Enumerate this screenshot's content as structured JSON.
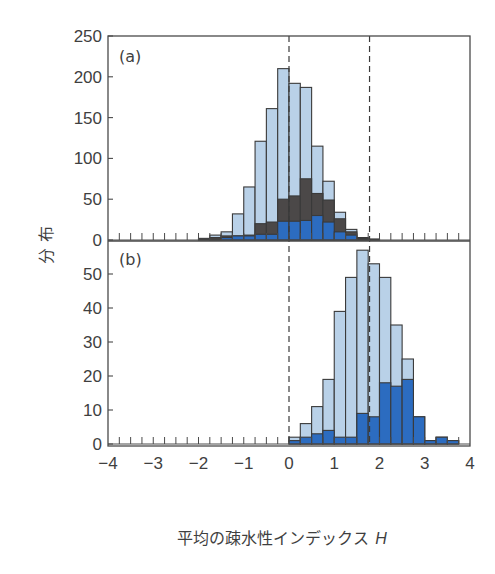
{
  "chart_data": [
    {
      "panel": "(a)",
      "type": "bar",
      "stacked_overlay": true,
      "bin_width": 0.25,
      "x_bin_starts": [
        -2.0,
        -1.75,
        -1.5,
        -1.25,
        -1.0,
        -0.75,
        -0.5,
        -0.25,
        0.0,
        0.25,
        0.5,
        0.75,
        1.0,
        1.25,
        1.5,
        1.75
      ],
      "series": [
        {
          "name": "total",
          "color": "#b9d1e8",
          "values": [
            2,
            6,
            10,
            32,
            65,
            121,
            161,
            210,
            192,
            187,
            115,
            72,
            34,
            13,
            3,
            1
          ]
        },
        {
          "name": "subset-dark",
          "color": "#4b4848",
          "values": [
            1,
            3,
            5,
            5,
            6,
            20,
            22,
            50,
            54,
            75,
            57,
            49,
            26,
            10,
            2,
            1
          ]
        },
        {
          "name": "subset-blue",
          "color": "#2c6cc0",
          "values": [
            0,
            1,
            3,
            5,
            5,
            7,
            7,
            23,
            23,
            24,
            30,
            22,
            10,
            6,
            1,
            0
          ]
        }
      ],
      "ylim": [
        0,
        250
      ],
      "yticks": [
        "0",
        "50",
        "100",
        "150",
        "200",
        "250"
      ],
      "ytick_values": [
        0,
        50,
        100,
        150,
        200,
        250
      ],
      "dashed_lines_x": [
        0.0,
        1.78
      ]
    },
    {
      "panel": "(b)",
      "type": "bar",
      "stacked_overlay": true,
      "bin_width": 0.25,
      "x_bin_starts": [
        0.0,
        0.25,
        0.5,
        0.75,
        1.0,
        1.25,
        1.5,
        1.75,
        2.0,
        2.25,
        2.5,
        2.75,
        3.0,
        3.25,
        3.5
      ],
      "series": [
        {
          "name": "total",
          "color": "#b9d1e8",
          "values": [
            2,
            6,
            11,
            19,
            39,
            49,
            57,
            53,
            49,
            35,
            25,
            8,
            1,
            2,
            1
          ]
        },
        {
          "name": "subset-blue",
          "color": "#2c6cc0",
          "values": [
            1,
            2,
            3,
            4,
            2,
            2,
            9,
            8,
            18,
            17,
            19,
            8,
            1,
            2,
            1
          ]
        }
      ],
      "ylim": [
        0,
        57
      ],
      "yticks": [
        "0",
        "10",
        "20",
        "30",
        "40",
        "50"
      ],
      "ytick_values": [
        0,
        10,
        20,
        30,
        40,
        50
      ],
      "dashed_lines_x": [
        0.0,
        1.78
      ]
    }
  ],
  "axes": {
    "xlim": [
      -4,
      4
    ],
    "xticks": [
      "−4",
      "−3",
      "−2",
      "−1",
      "0",
      "1",
      "2",
      "3",
      "4"
    ],
    "xtick_values": [
      -4,
      -3,
      -2,
      -1,
      0,
      1,
      2,
      3,
      4
    ],
    "minor_tick_step": 0.25,
    "xlabel": "平均の疎水性インデックス",
    "xlabel_var": "H",
    "ylabel": "分 布"
  },
  "labels": {
    "panel_a": "(a)",
    "panel_b": "(b)"
  },
  "colors": {
    "frame": "#4a4a4a",
    "bar_outline": "#3a3a3a",
    "light_blue": "#b9d1e8",
    "dark": "#4b4848",
    "blue": "#2c6cc0"
  }
}
